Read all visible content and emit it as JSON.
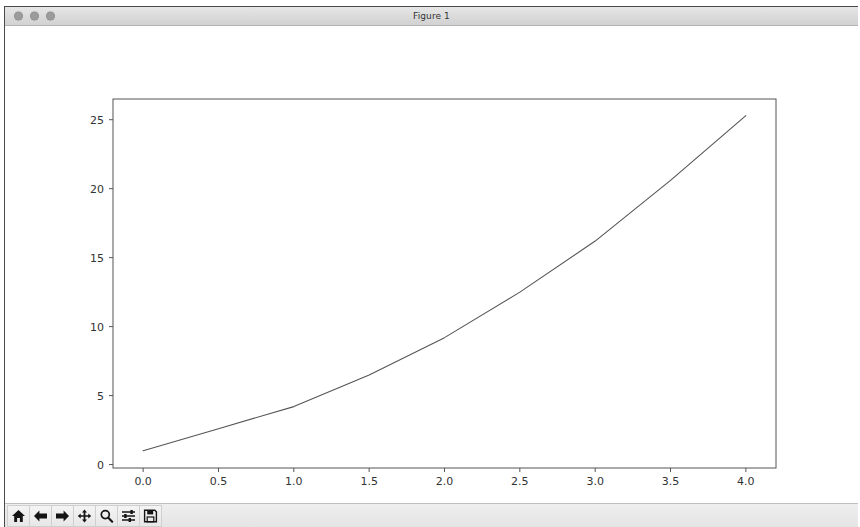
{
  "window": {
    "title": "Figure 1",
    "traffic_lights": [
      "close",
      "minimize",
      "maximize"
    ]
  },
  "toolbar": {
    "buttons": [
      {
        "name": "home-button",
        "label": "Home",
        "icon": "home-icon"
      },
      {
        "name": "back-button",
        "label": "Back",
        "icon": "arrow-left-icon"
      },
      {
        "name": "forward-button",
        "label": "Forward",
        "icon": "arrow-right-icon"
      },
      {
        "name": "pan-button",
        "label": "Pan",
        "icon": "move-cross-icon"
      },
      {
        "name": "zoom-button",
        "label": "Zoom to rectangle",
        "icon": "magnifier-icon"
      },
      {
        "name": "configure-subplots-button",
        "label": "Configure subplots",
        "icon": "sliders-icon"
      },
      {
        "name": "save-button",
        "label": "Save the figure",
        "icon": "floppy-disk-icon"
      }
    ]
  },
  "chart_data": {
    "type": "line",
    "title": "",
    "xlabel": "",
    "ylabel": "",
    "xlim": [
      -0.2,
      4.2
    ],
    "ylim": [
      -0.25,
      26.5
    ],
    "xticks": [
      "0.0",
      "0.5",
      "1.0",
      "1.5",
      "2.0",
      "2.5",
      "3.0",
      "3.5",
      "4.0"
    ],
    "xtick_values": [
      0.0,
      0.5,
      1.0,
      1.5,
      2.0,
      2.5,
      3.0,
      3.5,
      4.0
    ],
    "yticks": [
      "0",
      "5",
      "10",
      "15",
      "20",
      "25"
    ],
    "ytick_values": [
      0,
      5,
      10,
      15,
      20,
      25
    ],
    "grid": false,
    "legend": null,
    "line_color": "#555555",
    "line_width": 1.1,
    "series": [
      {
        "name": "series-1",
        "x": [
          0.0,
          0.5,
          1.0,
          1.5,
          2.0,
          2.5,
          3.0,
          3.5,
          4.0
        ],
        "values": [
          1.0,
          2.6,
          4.2,
          6.5,
          9.2,
          12.5,
          16.2,
          20.6,
          25.3
        ]
      }
    ]
  }
}
